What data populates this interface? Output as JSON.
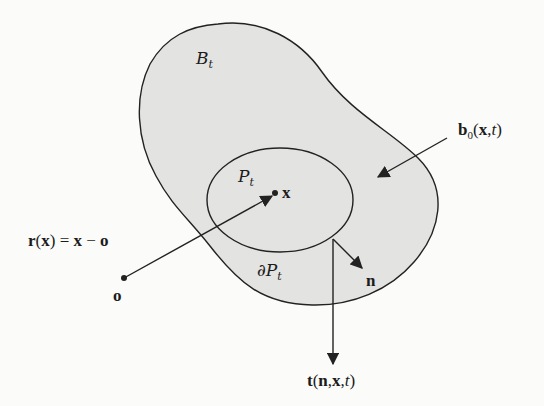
{
  "diagram": {
    "colors": {
      "background": "#fbfbfa",
      "region_fill": "#e3e3e2",
      "stroke": "#222222"
    },
    "regions": {
      "body": {
        "label": "B",
        "subscript": "t"
      },
      "subregion": {
        "label": "P",
        "subscript": "t"
      },
      "boundary": {
        "prefix": "∂",
        "label": "P",
        "subscript": "t"
      }
    },
    "points": {
      "origin": {
        "label": "o"
      },
      "material_point": {
        "label": "x"
      }
    },
    "vectors": {
      "position": {
        "lhs_func": "r",
        "lhs_arg": "x",
        "eq": "=",
        "rhs_a": "x",
        "minus": "−",
        "rhs_b": "o"
      },
      "body_force": {
        "func": "b",
        "subscript": "0",
        "args_bold": "x",
        "comma": ",",
        "arg_t": "t"
      },
      "normal": {
        "label": "n"
      },
      "traction": {
        "func": "t",
        "arg_n": "n",
        "arg_x": "x",
        "arg_t": "t"
      }
    }
  }
}
